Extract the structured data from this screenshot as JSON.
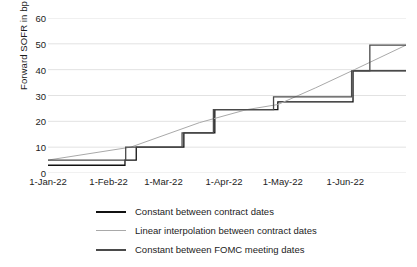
{
  "chart_data": {
    "type": "line",
    "title": "",
    "xlabel": "",
    "ylabel": "Forward SOFR in bp",
    "ylim": [
      0,
      60
    ],
    "yticks": [
      0,
      10,
      20,
      30,
      40,
      50,
      60
    ],
    "grid": true,
    "legend_position": "bottom",
    "xlabel_ticks": [
      "1-Jan-22",
      "1-Feb-22",
      "1-Mar-22",
      "1-Apr-22",
      "1-May-22",
      "1-Jun-22"
    ],
    "xlim": [
      "1-Jan-22",
      "1-Jul-22"
    ],
    "x_tick_fractions": [
      0.0,
      0.1694,
      0.3224,
      0.4918,
      0.6557,
      0.8306
    ],
    "series": [
      {
        "name": "Constant between contract dates",
        "color": "#111111",
        "style": "step",
        "points": [
          {
            "x": 0.0,
            "y": 3
          },
          {
            "x": 0.215,
            "y": 3
          },
          {
            "x": 0.215,
            "y": 5
          },
          {
            "x": 0.2465,
            "y": 5
          },
          {
            "x": 0.2465,
            "y": 10
          },
          {
            "x": 0.3795,
            "y": 10
          },
          {
            "x": 0.3795,
            "y": 15.5
          },
          {
            "x": 0.466,
            "y": 15.5
          },
          {
            "x": 0.466,
            "y": 24.5
          },
          {
            "x": 0.642,
            "y": 24.5
          },
          {
            "x": 0.642,
            "y": 27.5
          },
          {
            "x": 0.852,
            "y": 27.5
          },
          {
            "x": 0.852,
            "y": 39.5
          },
          {
            "x": 1.0,
            "y": 39.5
          }
        ]
      },
      {
        "name": "Linear interpolation between contract dates",
        "color": "#a9a9a9",
        "style": "line",
        "points": [
          {
            "x": 0.0,
            "y": 5
          },
          {
            "x": 0.231,
            "y": 10
          },
          {
            "x": 0.423,
            "y": 19.5
          },
          {
            "x": 0.554,
            "y": 24.5
          },
          {
            "x": 0.642,
            "y": 26.5
          },
          {
            "x": 0.748,
            "y": 33
          },
          {
            "x": 0.856,
            "y": 40
          },
          {
            "x": 1.0,
            "y": 49.5
          }
        ]
      },
      {
        "name": "Constant between FOMC meeting dates",
        "color": "#4a4a4a",
        "style": "step",
        "points": [
          {
            "x": 0.0,
            "y": 5
          },
          {
            "x": 0.217,
            "y": 5
          },
          {
            "x": 0.217,
            "y": 10
          },
          {
            "x": 0.3745,
            "y": 10
          },
          {
            "x": 0.3745,
            "y": 15.5
          },
          {
            "x": 0.462,
            "y": 15.5
          },
          {
            "x": 0.462,
            "y": 24.5
          },
          {
            "x": 0.63,
            "y": 24.5
          },
          {
            "x": 0.63,
            "y": 29.5
          },
          {
            "x": 0.848,
            "y": 29.5
          },
          {
            "x": 0.848,
            "y": 39.5
          },
          {
            "x": 0.899,
            "y": 39.5
          },
          {
            "x": 0.899,
            "y": 49.5
          },
          {
            "x": 1.0,
            "y": 49.5
          }
        ]
      }
    ]
  }
}
